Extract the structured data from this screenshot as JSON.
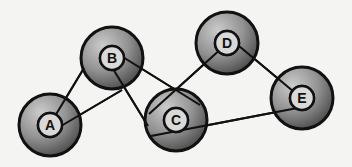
{
  "diagram": {
    "type": "graph",
    "nodes": [
      {
        "id": "A",
        "label": "A",
        "x": 50,
        "y": 125
      },
      {
        "id": "B",
        "label": "B",
        "x": 112,
        "y": 58
      },
      {
        "id": "C",
        "label": "C",
        "x": 176,
        "y": 120
      },
      {
        "id": "D",
        "label": "D",
        "x": 227,
        "y": 43
      },
      {
        "id": "E",
        "label": "E",
        "x": 302,
        "y": 98
      }
    ],
    "edges": [
      {
        "from": "A",
        "to": "B"
      },
      {
        "from": "A",
        "to": "B"
      },
      {
        "from": "B",
        "to": "C"
      },
      {
        "from": "B",
        "to": "C"
      },
      {
        "from": "C",
        "to": "D"
      },
      {
        "from": "D",
        "to": "E"
      },
      {
        "from": "C",
        "to": "E"
      }
    ],
    "colors": {
      "background": "#f4f4f2",
      "outline": "#111111",
      "node_light": "#b8b8b8",
      "node_dark": "#4a4a4a",
      "inner_fill": "#d9d9d9"
    }
  }
}
